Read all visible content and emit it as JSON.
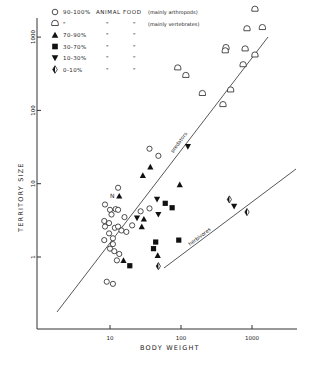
{
  "chart_data": {
    "type": "scatter",
    "title": "",
    "xlabel": "BODY WEIGHT",
    "ylabel": "TERRITORY SIZE",
    "xscale": "log",
    "yscale": "log",
    "xticks": [
      "10",
      "100",
      "1000"
    ],
    "yticks": [
      "1",
      "10",
      "100",
      "1000"
    ],
    "grid": false,
    "legend_position": "top-left",
    "legend": [
      {
        "symbol": "open-circle",
        "percent": "90-100%",
        "text": "ANIMAL FOOD",
        "note": "(mainly arthropods)"
      },
      {
        "symbol": "open-half-circle",
        "percent": "\"",
        "text": "\"",
        "note": "(mainly vertebrates)"
      },
      {
        "symbol": "filled-triangle-up",
        "percent": "70-90%",
        "text": "\"",
        "note": "\""
      },
      {
        "symbol": "filled-square",
        "percent": "30-70%",
        "text": "\"",
        "note": "\""
      },
      {
        "symbol": "filled-triangle-down",
        "percent": "10-30%",
        "text": "\"",
        "note": "\""
      },
      {
        "symbol": "half-filled-diamond",
        "percent": "0-10%",
        "text": "\"",
        "note": "\""
      }
    ],
    "annotations": [
      {
        "text": "predators",
        "type": "regression-line",
        "from": [
          1.8,
          0.1
        ],
        "to": [
          1050,
          1000
        ]
      },
      {
        "text": "herbivores",
        "type": "regression-line",
        "from": [
          33,
          0.8
        ],
        "to": [
          2400,
          18
        ]
      },
      {
        "text": "N",
        "near": [
          9,
          7
        ]
      }
    ],
    "series": [
      {
        "name": "90-100% animal food (mainly arthropods)",
        "symbol": "open-circle",
        "points": [
          [
            36,
            30
          ],
          [
            48,
            24
          ],
          [
            13,
            8.8
          ],
          [
            8.5,
            5.2
          ],
          [
            10,
            4.4
          ],
          [
            12,
            4.5
          ],
          [
            13,
            4.4
          ],
          [
            10.5,
            3.8
          ],
          [
            16,
            3.5
          ],
          [
            27,
            4.2
          ],
          [
            36,
            4.6
          ],
          [
            8.3,
            3.1
          ],
          [
            9.7,
            2.9
          ],
          [
            8.5,
            2.6
          ],
          [
            11.7,
            2.5
          ],
          [
            13,
            2.6
          ],
          [
            14.5,
            2.3
          ],
          [
            9.7,
            2.1
          ],
          [
            11,
            1.8
          ],
          [
            11,
            1.5
          ],
          [
            8.3,
            1.7
          ],
          [
            10,
            1.3
          ],
          [
            11.5,
            1.2
          ],
          [
            13.5,
            1.1
          ],
          [
            12.5,
            0.9
          ],
          [
            9,
            0.46
          ],
          [
            11,
            0.43
          ],
          [
            20.5,
            2.7
          ],
          [
            17,
            2.2
          ]
        ]
      },
      {
        "name": "90-100% animal food (mainly vertebrates)",
        "symbol": "open-half-circle",
        "points": [
          [
            1100,
            2400
          ],
          [
            850,
            1300
          ],
          [
            1400,
            1350
          ],
          [
            430,
            720
          ],
          [
            420,
            650
          ],
          [
            800,
            690
          ],
          [
            1100,
            570
          ],
          [
            750,
            420
          ],
          [
            90,
            380
          ],
          [
            117,
            300
          ],
          [
            200,
            170
          ],
          [
            500,
            190
          ],
          [
            390,
            120
          ]
        ]
      },
      {
        "name": "70-90% animal food",
        "symbol": "filled-triangle-up",
        "points": [
          [
            37,
            17
          ],
          [
            29,
            13
          ],
          [
            13.5,
            6.8
          ],
          [
            96,
            9.7
          ],
          [
            28,
            2.6
          ],
          [
            15.5,
            0.9
          ],
          [
            47,
            1.05
          ],
          [
            30,
            3.3
          ]
        ]
      },
      {
        "name": "30-70% animal food",
        "symbol": "filled-square",
        "points": [
          [
            60,
            5.4
          ],
          [
            93,
            1.7
          ],
          [
            75,
            4.7
          ],
          [
            19,
            0.76
          ],
          [
            41,
            1.3
          ],
          [
            44,
            1.6
          ]
        ]
      },
      {
        "name": "10-30% animal food",
        "symbol": "filled-triangle-down",
        "points": [
          [
            46,
            6.1
          ],
          [
            48,
            3.8
          ],
          [
            24,
            3.4
          ],
          [
            125,
            32
          ],
          [
            560,
            4.9
          ]
        ]
      },
      {
        "name": "0-10% animal food",
        "symbol": "half-filled-diamond",
        "points": [
          [
            48,
            0.75
          ],
          [
            480,
            6.1
          ],
          [
            850,
            4.1
          ]
        ]
      }
    ],
    "xlim": [
      1.3,
      3500
    ],
    "ylim": [
      0.09,
      4000
    ]
  }
}
